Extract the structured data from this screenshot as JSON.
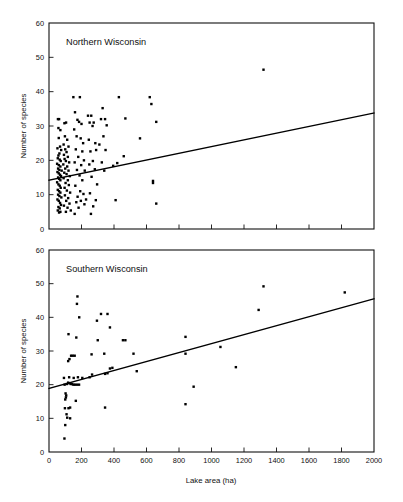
{
  "figure": {
    "background": "#ffffff",
    "ink_color": "#000000",
    "width": 403,
    "height": 502
  },
  "shared": {
    "xlabel": "Lake area (ha)",
    "ylabel": "Number of species",
    "xlim": [
      0,
      2000
    ],
    "ylim": [
      0,
      60
    ],
    "xticks": [
      0,
      200,
      400,
      600,
      800,
      1000,
      1200,
      1400,
      1600,
      1800,
      2000
    ],
    "yticks": [
      0,
      10,
      20,
      30,
      40,
      50,
      60
    ],
    "xticklabels": [
      "0",
      "200",
      "400",
      "600",
      "800",
      "1000",
      "1200",
      "1400",
      "1600",
      "1800",
      "2000"
    ],
    "yticklabels": [
      "0",
      "10",
      "20",
      "30",
      "40",
      "50",
      "60"
    ],
    "grid": false,
    "legend": "none"
  },
  "chart_data": [
    {
      "type": "scatter",
      "panel": "top",
      "title": "Northern Wisconsin",
      "xlabel": "",
      "ylabel": "Number of species",
      "xlim": [
        0,
        2000
      ],
      "ylim": [
        0,
        60
      ],
      "xticks": [
        0,
        200,
        400,
        600,
        800,
        1000,
        1200,
        1400,
        1600,
        1800,
        2000
      ],
      "yticks": [
        0,
        10,
        20,
        30,
        40,
        50,
        60
      ],
      "grid": false,
      "marker": "filled-square",
      "marker_size_px": 2.4,
      "fit_line": {
        "type": "linear-regression",
        "x_start": 0,
        "y_start": 14.2,
        "x_end": 2000,
        "y_end": 33.8
      },
      "points": [
        [
          55,
          32.0
        ],
        [
          62,
          32.0
        ],
        [
          58,
          29.4
        ],
        [
          70,
          28.8
        ],
        [
          60,
          26.5
        ],
        [
          68,
          24.0
        ],
        [
          52,
          23.5
        ],
        [
          75,
          23.0
        ],
        [
          64,
          22.0
        ],
        [
          58,
          21.4
        ],
        [
          54,
          20.6
        ],
        [
          66,
          20.2
        ],
        [
          72,
          19.8
        ],
        [
          50,
          19.0
        ],
        [
          60,
          18.6
        ],
        [
          70,
          18.2
        ],
        [
          56,
          17.6
        ],
        [
          64,
          17.2
        ],
        [
          78,
          17.0
        ],
        [
          52,
          16.6
        ],
        [
          60,
          16.2
        ],
        [
          68,
          15.8
        ],
        [
          74,
          15.4
        ],
        [
          56,
          15.0
        ],
        [
          62,
          14.6
        ],
        [
          70,
          14.2
        ],
        [
          50,
          13.6
        ],
        [
          58,
          13.0
        ],
        [
          66,
          12.6
        ],
        [
          72,
          12.0
        ],
        [
          54,
          11.4
        ],
        [
          62,
          11.0
        ],
        [
          70,
          10.6
        ],
        [
          56,
          10.0
        ],
        [
          64,
          9.6
        ],
        [
          76,
          9.2
        ],
        [
          52,
          8.6
        ],
        [
          60,
          8.2
        ],
        [
          68,
          7.6
        ],
        [
          74,
          7.0
        ],
        [
          58,
          6.4
        ],
        [
          66,
          6.0
        ],
        [
          54,
          5.4
        ],
        [
          70,
          5.0
        ],
        [
          62,
          4.8
        ],
        [
          95,
          30.8
        ],
        [
          105,
          31.0
        ],
        [
          98,
          27.0
        ],
        [
          112,
          26.0
        ],
        [
          90,
          24.6
        ],
        [
          120,
          24.0
        ],
        [
          100,
          23.2
        ],
        [
          108,
          22.4
        ],
        [
          92,
          21.6
        ],
        [
          116,
          21.0
        ],
        [
          96,
          20.4
        ],
        [
          104,
          19.8
        ],
        [
          124,
          19.4
        ],
        [
          88,
          18.8
        ],
        [
          112,
          18.2
        ],
        [
          100,
          17.6
        ],
        [
          120,
          17.0
        ],
        [
          94,
          16.4
        ],
        [
          108,
          16.0
        ],
        [
          128,
          15.4
        ],
        [
          90,
          14.8
        ],
        [
          116,
          14.2
        ],
        [
          102,
          13.4
        ],
        [
          122,
          12.8
        ],
        [
          96,
          12.0
        ],
        [
          110,
          11.2
        ],
        [
          130,
          10.6
        ],
        [
          98,
          9.8
        ],
        [
          118,
          9.0
        ],
        [
          106,
          8.2
        ],
        [
          126,
          7.4
        ],
        [
          92,
          6.8
        ],
        [
          114,
          6.2
        ],
        [
          134,
          5.4
        ],
        [
          104,
          5.0
        ],
        [
          150,
          38.4
        ],
        [
          190,
          38.4
        ],
        [
          160,
          34.0
        ],
        [
          175,
          31.8
        ],
        [
          185,
          31.2
        ],
        [
          155,
          29.0
        ],
        [
          200,
          30.6
        ],
        [
          170,
          27.0
        ],
        [
          195,
          26.4
        ],
        [
          210,
          25.0
        ],
        [
          165,
          23.2
        ],
        [
          205,
          22.6
        ],
        [
          180,
          21.0
        ],
        [
          215,
          20.0
        ],
        [
          158,
          19.4
        ],
        [
          198,
          18.6
        ],
        [
          172,
          17.2
        ],
        [
          220,
          17.0
        ],
        [
          188,
          15.6
        ],
        [
          205,
          14.2
        ],
        [
          162,
          12.6
        ],
        [
          192,
          11.0
        ],
        [
          212,
          10.2
        ],
        [
          176,
          9.4
        ],
        [
          228,
          8.6
        ],
        [
          196,
          8.2
        ],
        [
          168,
          7.8
        ],
        [
          218,
          7.2
        ],
        [
          182,
          6.2
        ],
        [
          158,
          4.4
        ],
        [
          240,
          33.0
        ],
        [
          260,
          33.0
        ],
        [
          250,
          31.0
        ],
        [
          275,
          31.0
        ],
        [
          268,
          30.0
        ],
        [
          245,
          26.0
        ],
        [
          285,
          25.0
        ],
        [
          255,
          22.6
        ],
        [
          290,
          23.0
        ],
        [
          270,
          19.8
        ],
        [
          248,
          18.8
        ],
        [
          282,
          17.4
        ],
        [
          262,
          15.2
        ],
        [
          296,
          13.0
        ],
        [
          252,
          10.4
        ],
        [
          288,
          8.4
        ],
        [
          272,
          6.6
        ],
        [
          258,
          4.4
        ],
        [
          330,
          35.2
        ],
        [
          320,
          32.0
        ],
        [
          345,
          32.0
        ],
        [
          355,
          30.2
        ],
        [
          335,
          27.0
        ],
        [
          310,
          24.6
        ],
        [
          348,
          23.0
        ],
        [
          325,
          19.4
        ],
        [
          340,
          17.0
        ],
        [
          430,
          38.4
        ],
        [
          470,
          32.2
        ],
        [
          420,
          19.2
        ],
        [
          395,
          18.4
        ],
        [
          460,
          21.2
        ],
        [
          410,
          8.4
        ],
        [
          560,
          26.4
        ],
        [
          620,
          38.4
        ],
        [
          630,
          36.4
        ],
        [
          660,
          31.2
        ],
        [
          640,
          14.0
        ],
        [
          640,
          13.4
        ],
        [
          660,
          7.4
        ],
        [
          1320,
          46.4
        ]
      ]
    },
    {
      "type": "scatter",
      "panel": "bottom",
      "title": "Southern Wisconsin",
      "xlabel": "Lake area (ha)",
      "ylabel": "Number of species",
      "xlim": [
        0,
        2000
      ],
      "ylim": [
        0,
        60
      ],
      "xticks": [
        0,
        200,
        400,
        600,
        800,
        1000,
        1200,
        1400,
        1600,
        1800,
        2000
      ],
      "yticks": [
        0,
        10,
        20,
        30,
        40,
        50,
        60
      ],
      "grid": false,
      "marker": "filled-square",
      "marker_size_px": 2.4,
      "fit_line": {
        "type": "linear-regression",
        "x_start": 0,
        "y_start": 18.9,
        "x_end": 2000,
        "y_end": 45.5
      },
      "points": [
        [
          95,
          4.0
        ],
        [
          100,
          8.0
        ],
        [
          108,
          11.2
        ],
        [
          112,
          10.2
        ],
        [
          130,
          10.0
        ],
        [
          98,
          13.0
        ],
        [
          120,
          13.0
        ],
        [
          130,
          13.2
        ],
        [
          100,
          15.6
        ],
        [
          104,
          16.2
        ],
        [
          106,
          16.8
        ],
        [
          102,
          17.4
        ],
        [
          165,
          15.2
        ],
        [
          96,
          20.0
        ],
        [
          110,
          20.2
        ],
        [
          118,
          20.6
        ],
        [
          126,
          20.4
        ],
        [
          134,
          20.2
        ],
        [
          142,
          20.2
        ],
        [
          150,
          20.0
        ],
        [
          160,
          20.0
        ],
        [
          172,
          20.0
        ],
        [
          185,
          20.0
        ],
        [
          92,
          22.0
        ],
        [
          124,
          22.2
        ],
        [
          152,
          22.0
        ],
        [
          178,
          22.2
        ],
        [
          205,
          22.0
        ],
        [
          250,
          22.2
        ],
        [
          265,
          23.0
        ],
        [
          345,
          23.2
        ],
        [
          360,
          23.4
        ],
        [
          375,
          24.8
        ],
        [
          390,
          25.0
        ],
        [
          540,
          24.0
        ],
        [
          118,
          27.0
        ],
        [
          126,
          27.6
        ],
        [
          136,
          28.6
        ],
        [
          146,
          28.6
        ],
        [
          158,
          28.6
        ],
        [
          262,
          29.0
        ],
        [
          340,
          29.2
        ],
        [
          520,
          29.2
        ],
        [
          840,
          29.2
        ],
        [
          120,
          35.0
        ],
        [
          168,
          34.0
        ],
        [
          300,
          33.2
        ],
        [
          455,
          33.2
        ],
        [
          470,
          33.2
        ],
        [
          840,
          34.2
        ],
        [
          1055,
          31.2
        ],
        [
          1150,
          25.2
        ],
        [
          295,
          39.0
        ],
        [
          186,
          40.0
        ],
        [
          320,
          41.0
        ],
        [
          360,
          41.0
        ],
        [
          375,
          37.0
        ],
        [
          172,
          44.0
        ],
        [
          175,
          46.2
        ],
        [
          1290,
          42.2
        ],
        [
          1320,
          49.2
        ],
        [
          1820,
          47.4
        ],
        [
          345,
          13.2
        ],
        [
          840,
          14.2
        ],
        [
          890,
          19.4
        ]
      ]
    }
  ]
}
